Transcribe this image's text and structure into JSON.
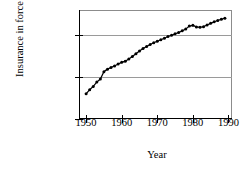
{
  "chart_data": {
    "type": "line",
    "title": "",
    "xlabel": "Year",
    "ylabel": "Insurance in force",
    "yscale": "log",
    "ylim": [
      1000,
      400000
    ],
    "xlim": [
      1948,
      1991
    ],
    "grid": true,
    "legend": null,
    "ytick_labels": [
      "1000",
      "10,000",
      "100,000"
    ],
    "ytick_values": [
      1000,
      10000,
      100000
    ],
    "xtick_labels": [
      "1950",
      "1960",
      "1970",
      "1980",
      "1990"
    ],
    "xtick_values": [
      1950,
      1960,
      1970,
      1980,
      1990
    ],
    "marker": "filled-circle",
    "x": [
      1950,
      1951,
      1952,
      1953,
      1954,
      1955,
      1956,
      1957,
      1958,
      1959,
      1960,
      1961,
      1962,
      1963,
      1964,
      1965,
      1966,
      1967,
      1968,
      1969,
      1970,
      1971,
      1972,
      1973,
      1974,
      1975,
      1976,
      1977,
      1978,
      1979,
      1980,
      1981,
      1982,
      1983,
      1984,
      1985,
      1986,
      1987,
      1988,
      1989
    ],
    "values": [
      4000,
      5000,
      6000,
      7600,
      9000,
      13500,
      15500,
      17000,
      18500,
      20500,
      22500,
      24000,
      27000,
      31000,
      36000,
      42000,
      48000,
      54000,
      60000,
      66000,
      72000,
      78000,
      85000,
      93000,
      100000,
      108000,
      116000,
      127000,
      140000,
      165000,
      172000,
      158000,
      155000,
      160000,
      175000,
      192000,
      210000,
      225000,
      240000,
      255000
    ]
  },
  "axis": {
    "ylabel": "Insurance in force",
    "xlabel": "Year"
  },
  "colors": {
    "line": "#000000",
    "marker": "#000000",
    "grid": "#9a9a9a",
    "frame": "#8c8c8c",
    "background": "#ffffff"
  }
}
